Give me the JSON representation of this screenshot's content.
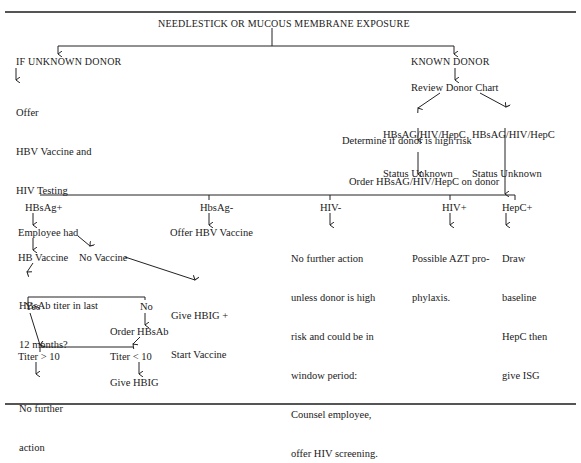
{
  "diagram": {
    "title": "NEEDLESTICK OR MUCOUS MEMBRANE EXPOSURE",
    "unknown_donor": {
      "heading": "IF UNKNOWN DONOR",
      "action_lines": [
        "Offer",
        "HBV Vaccine and",
        "HIV Testing"
      ]
    },
    "known_donor": {
      "heading": "KNOWN DONOR",
      "review": "Review Donor Chart",
      "status_left": [
        "HBsAG/HIV/HepC",
        "Status Unknown"
      ],
      "status_right": [
        "HBsAG/HIV/HepC",
        "Status Unknown"
      ],
      "determine": "Determine if donor is high risk",
      "order": "Order HBsAG/HIV/HepC on donor"
    },
    "outcomes": {
      "hbsag_pos": {
        "label": "HBsAg+",
        "employee_had": "Employee had",
        "hb_vaccine": "HB Vaccine",
        "no_vaccine": "No Vaccine",
        "titer_question": [
          "HBsAb titer in last",
          "12 months?"
        ],
        "give_hbig_lines": [
          "Give HBIG +",
          "Start Vaccine"
        ],
        "yes": "Yes",
        "no": "No",
        "order_hbsab": "Order HBsAb",
        "titer_gt": "Titer > 10",
        "titer_lt": "Titer < 10",
        "no_further_lines": [
          "No further",
          "action"
        ],
        "give_hbig": "Give HBIG"
      },
      "hbsag_neg": {
        "label": "HbsAg-",
        "action": "Offer HBV Vaccine"
      },
      "hiv_neg": {
        "label": "HIV-",
        "action_lines": [
          "No further action",
          "unless donor is high",
          "risk and could be in",
          "window period:",
          "Counsel employee,",
          "offer HIV screening."
        ]
      },
      "hiv_pos": {
        "label": "HIV+",
        "action_lines": [
          "Possible AZT pro-",
          "phylaxis."
        ]
      },
      "hepc_pos": {
        "label": "HepC+",
        "action_lines": [
          "Draw",
          "baseline",
          "HepC then",
          "give ISG"
        ]
      }
    }
  }
}
